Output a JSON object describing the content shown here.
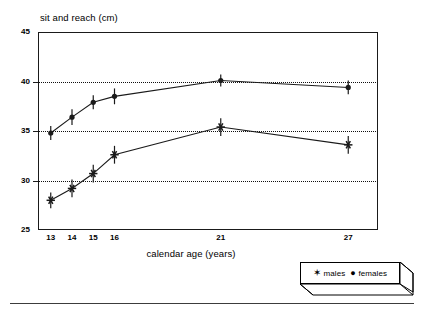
{
  "chart_data": {
    "type": "line",
    "title": "sit and reach (cm)",
    "xlabel": "calendar age (years)",
    "ylabel": "sit and reach (cm)",
    "x": [
      13,
      14,
      15,
      16,
      21,
      27
    ],
    "xtick_labels": [
      "13",
      "14",
      "15",
      "16",
      "21",
      "27"
    ],
    "ytick_labels": [
      "25",
      "30",
      "35",
      "40",
      "45"
    ],
    "yticks": [
      25,
      30,
      35,
      40,
      45
    ],
    "ylim": [
      25,
      45
    ],
    "xlim": [
      12.4,
      28.4
    ],
    "grid": "horizontal-dotted",
    "legend_position": "bottom-right-outside",
    "series": [
      {
        "name": "females",
        "marker": "filled-circle",
        "values": [
          34.8,
          36.4,
          37.9,
          38.5,
          40.1,
          39.4
        ],
        "errors": [
          0.7,
          0.8,
          0.7,
          0.8,
          0.6,
          0.7
        ]
      },
      {
        "name": "males",
        "marker": "asterisk",
        "values": [
          28.0,
          29.2,
          30.7,
          32.6,
          35.4,
          33.6
        ],
        "errors": [
          0.8,
          0.9,
          0.9,
          0.9,
          0.9,
          0.9
        ]
      }
    ]
  },
  "legend": {
    "items": [
      {
        "symbol": "✶",
        "label": "males"
      },
      {
        "symbol": "●",
        "label": "females"
      }
    ]
  },
  "colors": {
    "line": "#1a1a1a",
    "grid": "#111111",
    "axis": "#1a1a1a",
    "background": "#ffffff"
  }
}
